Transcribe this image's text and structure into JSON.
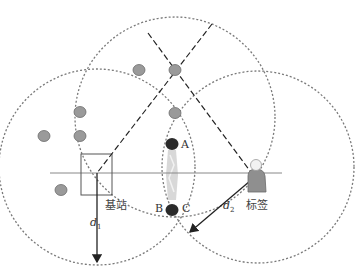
{
  "diagram": {
    "type": "trilateration-localization",
    "circles": [
      {
        "id": "top",
        "cx": 175,
        "cy": 117,
        "r": 100
      },
      {
        "id": "left",
        "cx": 97,
        "cy": 167,
        "r": 98
      },
      {
        "id": "right",
        "cx": 258,
        "cy": 167,
        "r": 96
      }
    ],
    "labels": {
      "base_station": "基站",
      "tag": "标签",
      "point_a": "A",
      "point_b": "B",
      "point_c": "C",
      "d1_main": "d",
      "d1_sub": "1",
      "d2_main": "d",
      "d2_sub": "2"
    },
    "nodes_gray": [
      {
        "x": 139,
        "y": 70
      },
      {
        "x": 175,
        "y": 70
      },
      {
        "x": 175,
        "y": 113
      },
      {
        "x": 80,
        "y": 112
      },
      {
        "x": 44,
        "y": 136
      },
      {
        "x": 80,
        "y": 136
      },
      {
        "x": 61,
        "y": 190
      }
    ],
    "points_dark": [
      {
        "name": "A",
        "x": 172,
        "y": 144
      },
      {
        "name": "C",
        "x": 172,
        "y": 210
      }
    ],
    "colors": {
      "circle_stroke": "#7a7a7a",
      "node_fill": "#9a9a9a",
      "dark_point": "#2b2b2b",
      "line": "#222222",
      "baseline": "#888888",
      "lens_fill": "#d4d4d4"
    }
  }
}
